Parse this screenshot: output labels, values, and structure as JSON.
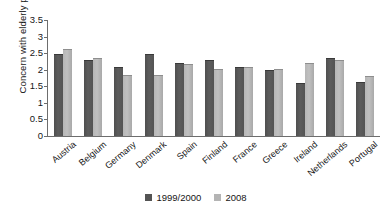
{
  "chart_data": {
    "type": "bar",
    "title": "",
    "xlabel": "",
    "ylabel": "Concern with elderly people",
    "ylim": [
      0,
      3.5
    ],
    "ytick_step": 0.5,
    "yticks": [
      "3.5",
      "3",
      "2.5",
      "2",
      "1.5",
      "1",
      "0.5",
      "0"
    ],
    "ytick_values": [
      3.5,
      3,
      2.5,
      2,
      1.5,
      1,
      0.5,
      0
    ],
    "grid": false,
    "legend_position": "bottom-center",
    "categories": [
      "Austria",
      "Belgium",
      "Germany",
      "Denmark",
      "Spain",
      "Finland",
      "France",
      "Greece",
      "Ireland",
      "Netherlands",
      "Portugal"
    ],
    "series": [
      {
        "name": "1999/2000",
        "color": "#545454",
        "values": [
          2.46,
          2.29,
          2.08,
          2.46,
          2.19,
          2.28,
          2.09,
          1.99,
          1.59,
          2.34,
          1.62
        ]
      },
      {
        "name": "2008",
        "color": "#b4b4b4",
        "values": [
          2.63,
          2.34,
          1.83,
          1.85,
          2.17,
          2.02,
          2.07,
          2.01,
          2.21,
          2.29,
          1.82
        ]
      }
    ]
  },
  "legend": {
    "items": [
      {
        "label": "1999/2000",
        "swatch": "dark-gray-square-icon"
      },
      {
        "label": "2008",
        "swatch": "light-gray-square-icon"
      }
    ]
  }
}
